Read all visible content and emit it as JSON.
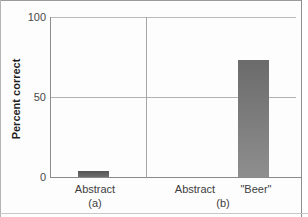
{
  "chart_data": {
    "type": "bar",
    "title": "",
    "subtitle": "",
    "xlabel": "",
    "ylabel": "Percent correct",
    "ylim": [
      0,
      100
    ],
    "yticks": [
      "0",
      "50",
      "100"
    ],
    "grid": true,
    "legend": null,
    "panels": [
      {
        "id": "a",
        "panel_label": "(a)",
        "categories": [
          "Abstract"
        ],
        "values": [
          4
        ]
      },
      {
        "id": "b",
        "panel_label": "(b)",
        "categories": [
          "Abstract",
          "\"Beer\""
        ],
        "values": [
          0,
          73
        ]
      }
    ],
    "colors": {
      "bar_a": "#565656",
      "bar_b_top": "#6b6b6b",
      "bar_b_bottom": "#8e8e8e",
      "axis": "#8a8a8a",
      "grid": "#b9b9b9",
      "text": "#3d3d3d"
    }
  },
  "axis": {
    "y_title": "Percent correct",
    "tick_100": "100",
    "tick_50": "50",
    "tick_0": "0"
  },
  "panel_a": {
    "category_abstract": "Abstract",
    "label": "(a)"
  },
  "panel_b": {
    "category_abstract": "Abstract",
    "category_beer": "\"Beer\"",
    "label": "(b)"
  }
}
